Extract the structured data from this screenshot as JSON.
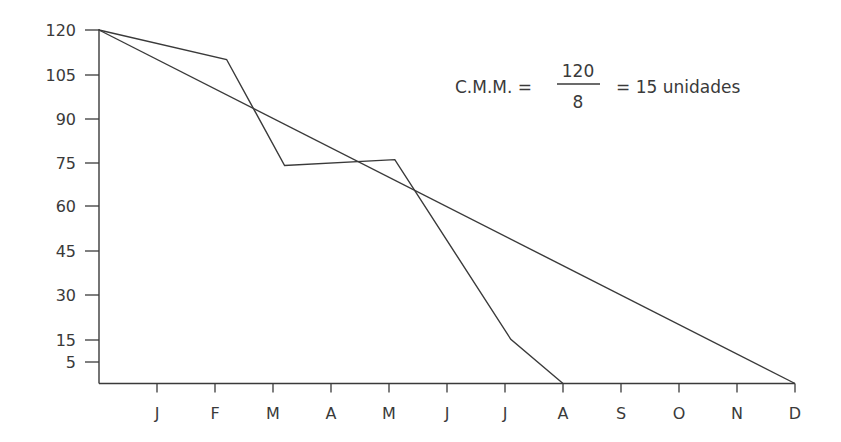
{
  "chart_data": {
    "type": "line",
    "title": "",
    "xlabel": "",
    "ylabel": "",
    "x_ticks": [
      "J",
      "F",
      "M",
      "A",
      "M",
      "J",
      "J",
      "A",
      "S",
      "O",
      "N",
      "D"
    ],
    "y_ticks": [
      "120",
      "105",
      "90",
      "75",
      "60",
      "45",
      "30",
      "15",
      "5"
    ],
    "ylim": [
      0,
      120
    ],
    "xlim": [
      0,
      12
    ],
    "grid": false,
    "legend": null,
    "series": [
      {
        "name": "consumo real",
        "x": [
          0,
          2.2,
          3.2,
          5.1,
          7.1,
          8
        ],
        "y": [
          120,
          110,
          74,
          76,
          15,
          0
        ]
      },
      {
        "name": "consumo medio mensual",
        "x": [
          0,
          12
        ],
        "y": [
          120,
          0
        ]
      }
    ],
    "annotation": {
      "lhs": "C.M.M. =",
      "numerator": "120",
      "denominator": "8",
      "rhs": "= 15 unidades"
    }
  },
  "colors": {
    "line": "#3a3a3a",
    "background": "#ffffff"
  }
}
